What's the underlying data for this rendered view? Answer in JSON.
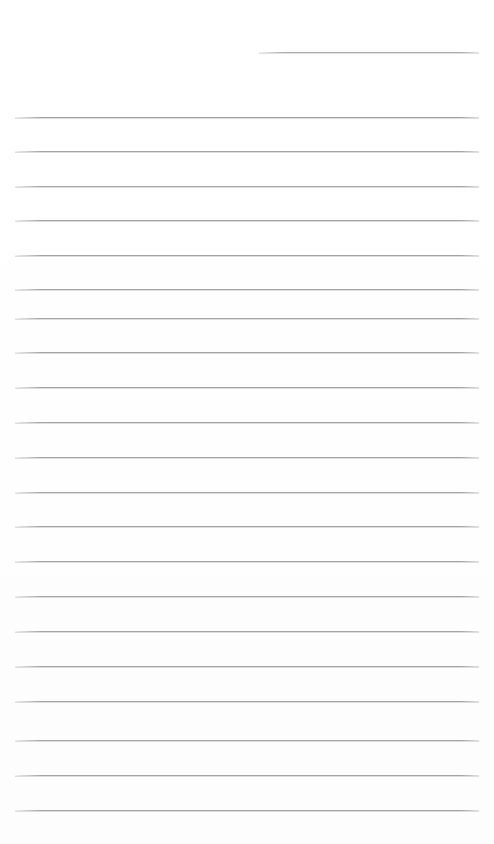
{
  "page": {
    "kind": "blank-ruled-paper-scan",
    "width_px": 494,
    "height_px": 844,
    "background_color": "#ffffff",
    "content_text": "",
    "has_handwriting": false,
    "has_printed_text": false
  },
  "ruling": {
    "line_color": "#9d9d9d",
    "line_thickness_px": 1,
    "line_spacing_px": 34.7,
    "left_margin_px": 15,
    "right_edge_px": 479,
    "total_lines": 22,
    "full_width_line_count": 21,
    "partial_line_count": 1
  },
  "lines": [
    {
      "name": "rule-partial-top",
      "y": 52,
      "x1": 259,
      "x2": 479,
      "partial": true
    },
    {
      "name": "rule-01",
      "y": 117,
      "x1": 15,
      "x2": 479,
      "partial": false
    },
    {
      "name": "rule-02",
      "y": 151,
      "x1": 15,
      "x2": 479,
      "partial": false
    },
    {
      "name": "rule-03",
      "y": 186,
      "x1": 15,
      "x2": 479,
      "partial": false
    },
    {
      "name": "rule-04",
      "y": 220,
      "x1": 15,
      "x2": 479,
      "partial": false
    },
    {
      "name": "rule-05",
      "y": 255,
      "x1": 15,
      "x2": 479,
      "partial": false
    },
    {
      "name": "rule-06",
      "y": 289,
      "x1": 15,
      "x2": 479,
      "partial": false
    },
    {
      "name": "rule-07",
      "y": 318,
      "x1": 15,
      "x2": 479,
      "partial": false
    },
    {
      "name": "rule-08",
      "y": 352,
      "x1": 15,
      "x2": 479,
      "partial": false
    },
    {
      "name": "rule-09",
      "y": 387,
      "x1": 15,
      "x2": 479,
      "partial": false
    },
    {
      "name": "rule-10",
      "y": 422,
      "x1": 15,
      "x2": 479,
      "partial": false
    },
    {
      "name": "rule-11",
      "y": 457,
      "x1": 15,
      "x2": 479,
      "partial": false
    },
    {
      "name": "rule-12",
      "y": 492,
      "x1": 15,
      "x2": 479,
      "partial": false
    },
    {
      "name": "rule-13",
      "y": 526,
      "x1": 15,
      "x2": 479,
      "partial": false
    },
    {
      "name": "rule-14",
      "y": 561,
      "x1": 15,
      "x2": 479,
      "partial": false
    },
    {
      "name": "rule-15",
      "y": 596,
      "x1": 15,
      "x2": 479,
      "partial": false
    },
    {
      "name": "rule-16",
      "y": 631,
      "x1": 15,
      "x2": 479,
      "partial": false
    },
    {
      "name": "rule-17",
      "y": 666,
      "x1": 15,
      "x2": 479,
      "partial": false
    },
    {
      "name": "rule-18",
      "y": 701,
      "x1": 15,
      "x2": 479,
      "partial": false
    },
    {
      "name": "rule-19",
      "y": 740,
      "x1": 15,
      "x2": 479,
      "partial": false
    },
    {
      "name": "rule-20",
      "y": 775,
      "x1": 15,
      "x2": 479,
      "partial": false
    },
    {
      "name": "rule-21",
      "y": 810,
      "x1": 15,
      "x2": 479,
      "partial": false
    }
  ]
}
